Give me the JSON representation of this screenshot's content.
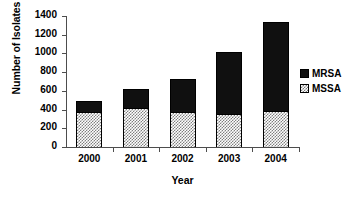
{
  "chart_data": {
    "type": "bar",
    "title": "",
    "subtitle": "",
    "xlabel": "Year",
    "ylabel": "Number of Isolates",
    "categories": [
      "2000",
      "2001",
      "2002",
      "2003",
      "2004"
    ],
    "series": [
      {
        "name": "MSSA",
        "values": [
          375,
          415,
          375,
          350,
          385
        ],
        "color": "#ffffff",
        "pattern": "checkerboard-hatch"
      },
      {
        "name": "MRSA",
        "values": [
          115,
          205,
          355,
          665,
          950
        ],
        "color": "#101010",
        "pattern": "solid"
      }
    ],
    "totals": [
      490,
      620,
      730,
      1015,
      1335
    ],
    "stacked": true,
    "stack_order": [
      "MSSA",
      "MRSA"
    ],
    "ylim": [
      0,
      1400
    ],
    "ytick_labels": [
      "0",
      "200",
      "400",
      "600",
      "800",
      "1000",
      "1200",
      "1400"
    ],
    "ytick_values": [
      0,
      200,
      400,
      600,
      800,
      1000,
      1200,
      1400
    ],
    "grid": false,
    "legend_position": "right",
    "legend_entries": [
      "MRSA",
      "MSSA"
    ],
    "axis_color": "#4d4d4d"
  },
  "axes": {
    "y_title": "Number of Isolates",
    "x_title": "Year"
  },
  "legend": {
    "items": [
      {
        "label": "MRSA",
        "swatch": "solid-black-swatch"
      },
      {
        "label": "MSSA",
        "swatch": "hatched-swatch"
      }
    ]
  }
}
